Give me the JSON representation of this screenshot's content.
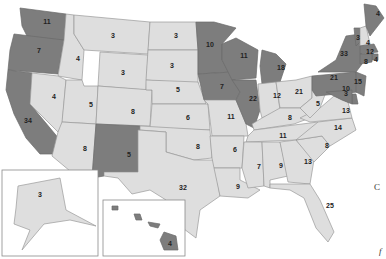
{
  "map": {
    "title": "",
    "colors": {
      "dark": "#7d7d7d",
      "light": "#dedede",
      "border": "#9a9a9a",
      "background": "#ffffff"
    },
    "states": [
      {
        "id": "WA",
        "votes": "11",
        "shade": "dark"
      },
      {
        "id": "OR",
        "votes": "7",
        "shade": "dark"
      },
      {
        "id": "CA",
        "votes": "34",
        "shade": "dark"
      },
      {
        "id": "ID",
        "votes": "4",
        "shade": "light"
      },
      {
        "id": "NV",
        "votes": "4",
        "shade": "light"
      },
      {
        "id": "MT",
        "votes": "3",
        "shade": "light"
      },
      {
        "id": "WY",
        "votes": "3",
        "shade": "light"
      },
      {
        "id": "UT",
        "votes": "5",
        "shade": "light"
      },
      {
        "id": "AZ",
        "votes": "8",
        "shade": "light"
      },
      {
        "id": "CO",
        "votes": "8",
        "shade": "light"
      },
      {
        "id": "NM",
        "votes": "5",
        "shade": "dark"
      },
      {
        "id": "ND",
        "votes": "3",
        "shade": "light"
      },
      {
        "id": "SD",
        "votes": "3",
        "shade": "light"
      },
      {
        "id": "NE",
        "votes": "5",
        "shade": "light"
      },
      {
        "id": "KS",
        "votes": "6",
        "shade": "light"
      },
      {
        "id": "OK",
        "votes": "8",
        "shade": "light"
      },
      {
        "id": "TX",
        "votes": "32",
        "shade": "light"
      },
      {
        "id": "MN",
        "votes": "10",
        "shade": "dark"
      },
      {
        "id": "IA",
        "votes": "7",
        "shade": "dark"
      },
      {
        "id": "MO",
        "votes": "11",
        "shade": "light"
      },
      {
        "id": "AR",
        "votes": "6",
        "shade": "light"
      },
      {
        "id": "LA",
        "votes": "9",
        "shade": "light"
      },
      {
        "id": "WI",
        "votes": "11",
        "shade": "dark"
      },
      {
        "id": "IL",
        "votes": "22",
        "shade": "dark"
      },
      {
        "id": "MI",
        "votes": "18",
        "shade": "dark"
      },
      {
        "id": "IN",
        "votes": "12",
        "shade": "light"
      },
      {
        "id": "OH",
        "votes": "21",
        "shade": "light"
      },
      {
        "id": "KY",
        "votes": "8",
        "shade": "light"
      },
      {
        "id": "TN",
        "votes": "11",
        "shade": "light"
      },
      {
        "id": "MS",
        "votes": "7",
        "shade": "light"
      },
      {
        "id": "AL",
        "votes": "9",
        "shade": "light"
      },
      {
        "id": "GA",
        "votes": "13",
        "shade": "light"
      },
      {
        "id": "FL",
        "votes": "25",
        "shade": "light"
      },
      {
        "id": "SC",
        "votes": "8",
        "shade": "light"
      },
      {
        "id": "NC",
        "votes": "14",
        "shade": "light"
      },
      {
        "id": "VA",
        "votes": "13",
        "shade": "light"
      },
      {
        "id": "WV",
        "votes": "5",
        "shade": "light"
      },
      {
        "id": "PA",
        "votes": "21",
        "shade": "dark"
      },
      {
        "id": "NY",
        "votes": "33",
        "shade": "dark"
      },
      {
        "id": "VT",
        "votes": "3",
        "shade": "dark"
      },
      {
        "id": "NH",
        "votes": "4",
        "shade": "light"
      },
      {
        "id": "ME",
        "votes": "4",
        "shade": "dark"
      },
      {
        "id": "MA",
        "votes": "12",
        "shade": "dark"
      },
      {
        "id": "RI",
        "votes": "4",
        "shade": "dark"
      },
      {
        "id": "CT",
        "votes": "8",
        "shade": "dark"
      },
      {
        "id": "NJ",
        "votes": "15",
        "shade": "dark"
      },
      {
        "id": "DE",
        "votes": "3",
        "shade": "dark"
      },
      {
        "id": "MD",
        "votes": "10",
        "shade": "dark"
      },
      {
        "id": "AK",
        "votes": "3",
        "shade": "light"
      },
      {
        "id": "HI",
        "votes": "4",
        "shade": "dark"
      }
    ]
  },
  "edge_text": {
    "right_c": "C",
    "right_f": "f"
  }
}
